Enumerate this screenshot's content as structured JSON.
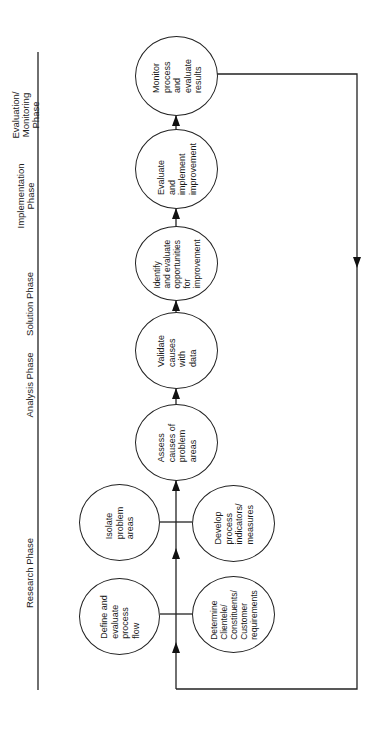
{
  "phases": [
    {
      "label": "Evaluation/\nMonitoring\nPhase"
    },
    {
      "label": "Implementation\nPhase"
    },
    {
      "label": "Solution Phase"
    },
    {
      "label": "Analysis Phase"
    },
    {
      "label": "Research Phase"
    }
  ],
  "nodes": {
    "monitor": "Monitor\nprocess\nand\nevaluate\nresults",
    "evaluate_implement": "Evaluate\nand\nimplement\nimprovement",
    "identify": "Identify\nand evaluate\nopportunities\nfor\nimprovement",
    "validate": "Validate\ncauses\nwith\ndata",
    "assess": "Assess\ncauses of\nproblem\nareas",
    "isolate": "Isolate\nproblem\nareas",
    "develop": "Develop\nprocess\nindicators/\nmeasures",
    "define": "Define and\nevaluate\nprocess\nflow",
    "determine": "Determine\nClientele/\nConstituents/\nCustomer\nrequirements"
  },
  "colors": {
    "line": "#222222",
    "background": "#ffffff"
  }
}
